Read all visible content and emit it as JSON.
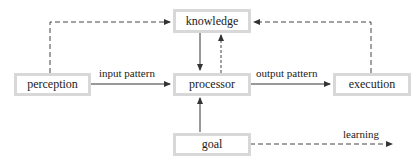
{
  "diagram": {
    "nodes": {
      "knowledge": "knowledge",
      "perception": "perception",
      "processor": "processor",
      "execution": "execution",
      "goal": "goal"
    },
    "edge_labels": {
      "input_pattern": "input pattern",
      "output_pattern": "output pattern",
      "learning": "learning"
    },
    "edges": [
      {
        "from": "perception",
        "to": "knowledge",
        "style": "dashed"
      },
      {
        "from": "perception",
        "to": "processor",
        "style": "solid",
        "label": "input pattern"
      },
      {
        "from": "knowledge",
        "to": "processor",
        "style": "solid"
      },
      {
        "from": "processor",
        "to": "knowledge",
        "style": "dashed"
      },
      {
        "from": "processor",
        "to": "execution",
        "style": "solid",
        "label": "output pattern"
      },
      {
        "from": "execution",
        "to": "knowledge",
        "style": "dashed"
      },
      {
        "from": "goal",
        "to": "processor",
        "style": "solid"
      },
      {
        "from": "goal",
        "to": "learning",
        "style": "dashed",
        "label": "learning"
      }
    ],
    "colors": {
      "box_border": "#d8d8d8",
      "line": "#333333",
      "text": "#222222"
    }
  }
}
